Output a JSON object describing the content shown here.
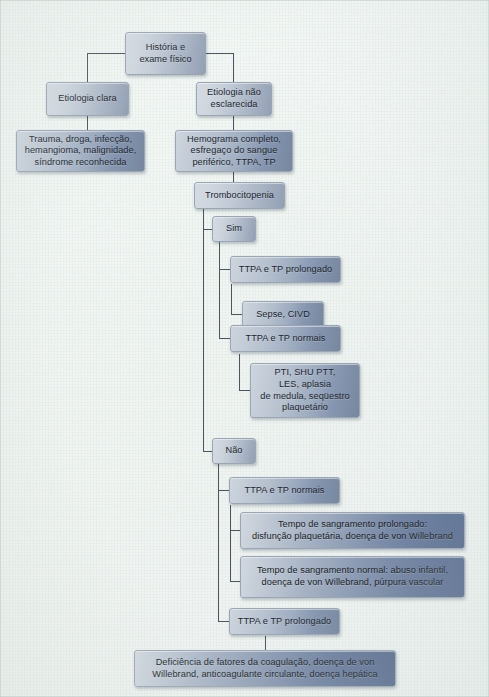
{
  "diagram": {
    "language": "pt-BR",
    "type": "flowchart",
    "line_color": "#4a5560",
    "box_border_color": "#9aa6b4",
    "background_color": "#f1f5f2",
    "nodes": [
      {
        "id": "n1",
        "label": "História e\nexame físico"
      },
      {
        "id": "n2",
        "label": "Etiologia clara"
      },
      {
        "id": "n3",
        "label": "Etiologia não\nesclarecida"
      },
      {
        "id": "n4",
        "label": "Trauma, droga, infecção,\nhemangioma, malignidade,\nsíndrome reconhecida"
      },
      {
        "id": "n5",
        "label": "Hemograma completo,\nesfregaço do sangue\nperiférico, TTPA, TP"
      },
      {
        "id": "n6",
        "label": "Trombocitopenia"
      },
      {
        "id": "n7",
        "label": "Sim"
      },
      {
        "id": "n8",
        "label": "TTPA e TP prolongado"
      },
      {
        "id": "n9",
        "label": "Sepse, CIVD"
      },
      {
        "id": "n10",
        "label": "TTPA e TP normais"
      },
      {
        "id": "n11",
        "label": "PTI, SHU PTT,\nLES, aplasia\nde medula, seqüestro\nplaquetário"
      },
      {
        "id": "n12",
        "label": "Não"
      },
      {
        "id": "n13",
        "label": "TTPA e TP normais"
      },
      {
        "id": "n14",
        "label": "Tempo de sangramento prolongado:\ndisfunção plaquetária, doença de von Willebrand"
      },
      {
        "id": "n15",
        "label": "Tempo de sangramento normal: abuso infantil,\ndoença de von Willebrand, púrpura vascular"
      },
      {
        "id": "n16",
        "label": "TTPA e TP prolongado"
      },
      {
        "id": "n17",
        "label": "Deficiência de fatores da coagulação, doença de von\nWillebrand, anticoagulante circulante, doença hepática"
      }
    ]
  }
}
